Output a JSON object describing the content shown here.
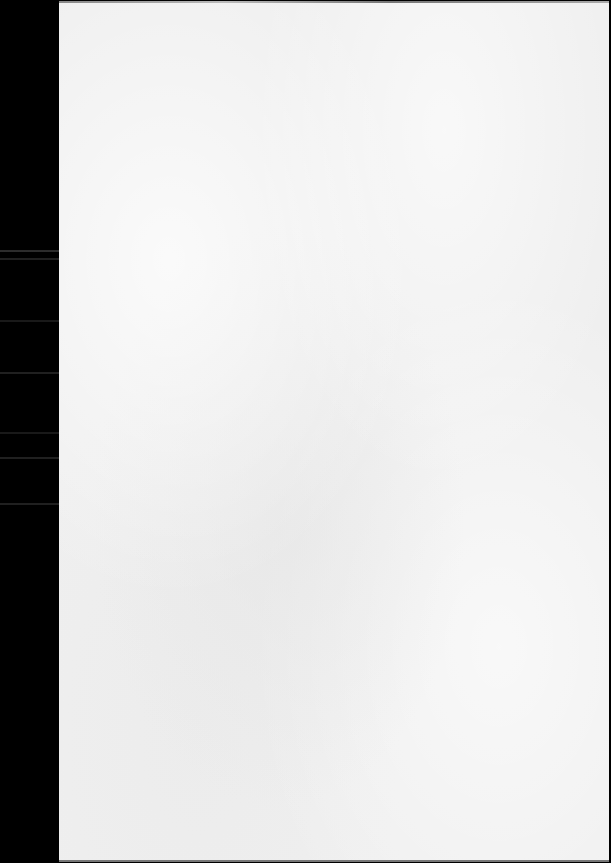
{
  "document": {
    "type": "scanned-page",
    "content": "",
    "colors": {
      "background": "#000000",
      "paper": "#efefef"
    }
  }
}
